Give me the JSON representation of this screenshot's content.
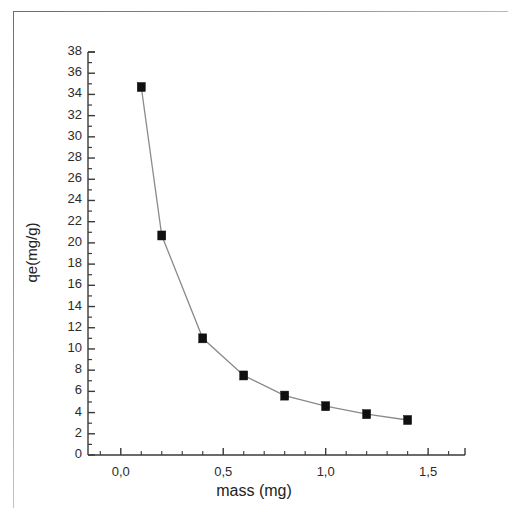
{
  "figure": {
    "background_color": "#ffffff",
    "frame_color": "#6d6d6d",
    "axis_color": "#3a3a3a",
    "series_line_color": "#8a8a8a",
    "marker_color": "#101010"
  },
  "chart_data": {
    "type": "line",
    "title": "",
    "subtitle": "",
    "xlabel": "mass (mg)",
    "ylabel": "qe(mg/g)",
    "x": [
      0.1,
      0.2,
      0.4,
      0.6,
      0.8,
      1.0,
      1.2,
      1.4
    ],
    "values": [
      34.7,
      20.7,
      11.0,
      7.5,
      5.6,
      4.6,
      3.85,
      3.3
    ],
    "series": [
      {
        "name": "qe",
        "x": [
          0.1,
          0.2,
          0.4,
          0.6,
          0.8,
          1.0,
          1.2,
          1.4
        ],
        "values": [
          34.7,
          20.7,
          11.0,
          7.5,
          5.6,
          4.6,
          3.85,
          3.3
        ],
        "marker": "filled-square",
        "marker_color": "#101010",
        "line_color": "#8a8a8a"
      }
    ],
    "xlim": [
      -0.16,
      1.68
    ],
    "ylim": [
      0,
      38
    ],
    "xticks": [
      0.0,
      0.5,
      1.0,
      1.5
    ],
    "xtick_labels": [
      "0,0",
      "0,5",
      "1,0",
      "1,5"
    ],
    "xtick_minor_step": 0.1,
    "yticks": [
      0,
      2,
      4,
      6,
      8,
      10,
      12,
      14,
      16,
      18,
      20,
      22,
      24,
      26,
      28,
      30,
      32,
      34,
      36,
      38
    ],
    "ytick_labels": [
      "0",
      "2",
      "4",
      "6",
      "8",
      "10",
      "12",
      "14",
      "16",
      "18",
      "20",
      "22",
      "24",
      "26",
      "28",
      "30",
      "32",
      "34",
      "36",
      "38"
    ],
    "ytick_minor_step": 1,
    "grid": false,
    "legend": false,
    "legend_position": "none",
    "decimal_separator": ",",
    "annotations": []
  }
}
